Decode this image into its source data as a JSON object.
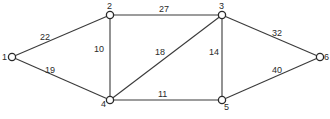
{
  "graph": {
    "nodes": [
      {
        "id": "1",
        "label": "1",
        "x": 12,
        "y": 57,
        "lx": 2,
        "ly": 60
      },
      {
        "id": "2",
        "label": "2",
        "x": 110,
        "y": 15,
        "lx": 107,
        "ly": 9
      },
      {
        "id": "3",
        "label": "3",
        "x": 222,
        "y": 15,
        "lx": 219,
        "ly": 9
      },
      {
        "id": "4",
        "label": "4",
        "x": 110,
        "y": 100,
        "lx": 101,
        "ly": 107
      },
      {
        "id": "5",
        "label": "5",
        "x": 222,
        "y": 100,
        "lx": 224,
        "ly": 110
      },
      {
        "id": "6",
        "label": "6",
        "x": 320,
        "y": 57,
        "lx": 324,
        "ly": 60
      }
    ],
    "edges": [
      {
        "from": "1",
        "to": "2",
        "weight": "22",
        "lx": 40,
        "ly": 40
      },
      {
        "from": "1",
        "to": "4",
        "weight": "19",
        "lx": 45,
        "ly": 73
      },
      {
        "from": "2",
        "to": "3",
        "weight": "27",
        "lx": 159,
        "ly": 12
      },
      {
        "from": "2",
        "to": "4",
        "weight": "10",
        "lx": 94,
        "ly": 52
      },
      {
        "from": "3",
        "to": "4",
        "weight": "18",
        "lx": 155,
        "ly": 55
      },
      {
        "from": "3",
        "to": "5",
        "weight": "14",
        "lx": 209,
        "ly": 55
      },
      {
        "from": "3",
        "to": "6",
        "weight": "32",
        "lx": 272,
        "ly": 36
      },
      {
        "from": "4",
        "to": "5",
        "weight": "11",
        "lx": 158,
        "ly": 97
      },
      {
        "from": "5",
        "to": "6",
        "weight": "40",
        "lx": 272,
        "ly": 73
      }
    ]
  }
}
